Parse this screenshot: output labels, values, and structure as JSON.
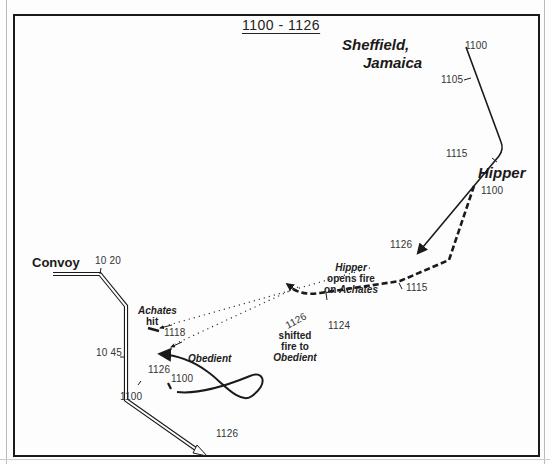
{
  "title": "1100 - 1126",
  "ships": {
    "sheffield": {
      "name_line1": "Sheffield,",
      "name_line2": "Jamaica",
      "times": [
        "1100",
        "1105",
        "1115",
        "1126"
      ],
      "path": "M 466 47 L 502 144 Q 505 150 500 158 L 418 253"
    },
    "hipper": {
      "name": "Hipper",
      "times": [
        "1100",
        "1115",
        "1124"
      ],
      "path": "M 472 186 L 448 262 L 398 283 L 315 296 Q 300 296 290 289"
    },
    "convoy": {
      "name": "Convoy",
      "times": [
        "10 20",
        "10 45",
        "1100",
        "1126"
      ],
      "path": "M 53 275 L 101 275 L 128 308 L 128 398 L 202 454"
    },
    "achates": {
      "name": "Achates",
      "status": "hit",
      "time": "1118"
    },
    "obedient": {
      "name": "Obedient",
      "times": [
        "1126",
        "1100"
      ],
      "path": "M 196 385 C 230 380 270 360 255 350 C 240 335 205 400 240 418 C 260 420 270 380 158 347"
    }
  },
  "annotations": {
    "hipper_opens_fire": {
      "line1": "Hipper",
      "line2": "opens fire",
      "line3": "on",
      "line4": "Achates"
    },
    "shifted_fire": {
      "line1": "shifted",
      "line2": "fire to",
      "line3": "Obedient"
    },
    "fire_line_time": "1126"
  },
  "colors": {
    "ink": "#1a1a1a",
    "background": "#fdfdfd",
    "frame": "#1a1a1a"
  }
}
